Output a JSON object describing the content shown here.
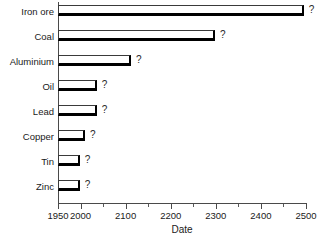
{
  "chart_data": {
    "type": "bar",
    "orientation": "horizontal",
    "title": "",
    "xlabel": "Date",
    "ylabel": "",
    "xlim": [
      1950,
      2500
    ],
    "grid": false,
    "legend": null,
    "categories": [
      "Iron ore",
      "Coal",
      "Aluminium",
      "Oil",
      "Lead",
      "Copper",
      "Tin",
      "Zinc"
    ],
    "values": [
      2495,
      2298,
      2112,
      2036,
      2036,
      2010,
      1998,
      1998
    ],
    "point_labels": [
      "?",
      "?",
      "?",
      "?",
      "?",
      "?",
      "?",
      "?"
    ],
    "xticks": [
      1950,
      2000,
      2100,
      2200,
      2300,
      2400,
      2500
    ],
    "xtick_labels": [
      "1950",
      "2000",
      "2100",
      "2200",
      "2300",
      "2400",
      "2500"
    ],
    "minor_xticks": [
      2050,
      2150,
      2250,
      2350,
      2450
    ],
    "bar_style": {
      "fill": "#ffffff",
      "outline": "#3a3a3a",
      "shadow": "#000000"
    },
    "bars": [
      {
        "category": "Iron ore",
        "value": 2495,
        "annotation": "?"
      },
      {
        "category": "Coal",
        "value": 2298,
        "annotation": "?"
      },
      {
        "category": "Aluminium",
        "value": 2112,
        "annotation": "?"
      },
      {
        "category": "Oil",
        "value": 2036,
        "annotation": "?"
      },
      {
        "category": "Lead",
        "value": 2036,
        "annotation": "?"
      },
      {
        "category": "Copper",
        "value": 2010,
        "annotation": "?"
      },
      {
        "category": "Tin",
        "value": 1998,
        "annotation": "?"
      },
      {
        "category": "Zinc",
        "value": 1998,
        "annotation": "?"
      }
    ]
  }
}
